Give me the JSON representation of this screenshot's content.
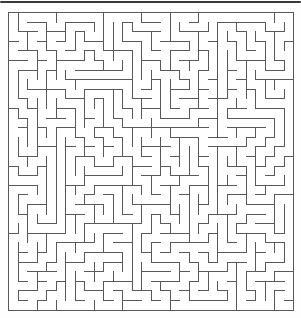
{
  "page": {
    "background": "#fefefe",
    "width": 301,
    "height": 318
  },
  "top_bar": {
    "color": "#3a3a3a",
    "x": 0,
    "y": 1,
    "width": 301,
    "height": 2
  },
  "maze": {
    "cols": 30,
    "rows": 31,
    "cell_width": 9.5,
    "cell_height": 9.6,
    "offset_x": 8,
    "offset_y": 12,
    "line_color": "#595959",
    "line_width": 1,
    "background": "#ffffff",
    "border": "closed",
    "entrance_gap": "none-visible",
    "exit_gap": "none-visible",
    "algorithm": "recursive-backtracker",
    "seed": 1337
  }
}
